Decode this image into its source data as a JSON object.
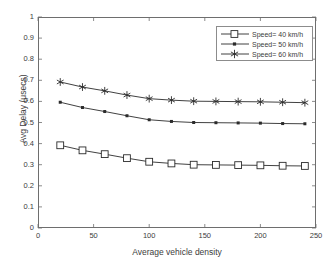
{
  "chart_data": {
    "type": "line",
    "title": "",
    "xlabel": "Average vehicle density",
    "ylabel": "Avg Delay (μsecs)",
    "xlim": [
      0,
      250
    ],
    "ylim": [
      0,
      1
    ],
    "xticks": [
      "0",
      "50",
      "100",
      "150",
      "200",
      "250"
    ],
    "xtick_values": [
      0,
      50,
      100,
      150,
      200,
      250
    ],
    "yticks": [
      "0",
      "0.1",
      "0.2",
      "0.3",
      "0.4",
      "0.5",
      "0.6",
      "0.7",
      "0.8",
      "0.9",
      "1"
    ],
    "ytick_values": [
      0,
      0.1,
      0.2,
      0.3,
      0.4,
      0.5,
      0.6,
      0.7,
      0.8,
      0.9,
      1
    ],
    "grid": false,
    "legend_position": "top-right",
    "x": [
      20,
      40,
      60,
      80,
      100,
      120,
      140,
      160,
      180,
      200,
      220,
      240
    ],
    "series": [
      {
        "name": "Speed= 40 km/h",
        "marker": "square",
        "color": "#2b2b2b",
        "values": [
          0.392,
          0.368,
          0.35,
          0.331,
          0.314,
          0.306,
          0.3,
          0.299,
          0.298,
          0.297,
          0.295,
          0.294
        ]
      },
      {
        "name": "Speed= 50 km/h",
        "marker": "dot",
        "color": "#2b2b2b",
        "values": [
          0.596,
          0.571,
          0.552,
          0.532,
          0.513,
          0.505,
          0.5,
          0.499,
          0.498,
          0.497,
          0.495,
          0.494
        ]
      },
      {
        "name": "Speed= 60 km/h",
        "marker": "star",
        "color": "#2b2b2b",
        "values": [
          0.692,
          0.668,
          0.65,
          0.63,
          0.613,
          0.606,
          0.601,
          0.6,
          0.599,
          0.598,
          0.596,
          0.594
        ]
      }
    ]
  },
  "legend": {
    "entries": [
      {
        "label": "Speed= 40 km/h"
      },
      {
        "label": "Speed= 50 km/h"
      },
      {
        "label": "Speed= 60 km/h"
      }
    ]
  },
  "caption_fragment": ""
}
